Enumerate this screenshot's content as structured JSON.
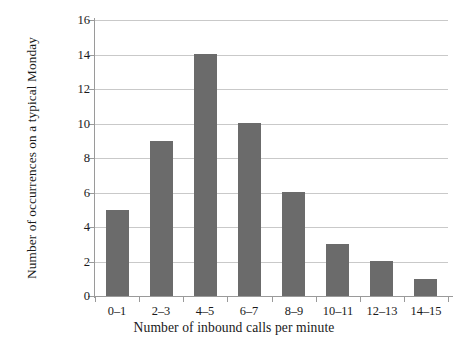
{
  "chart_data": {
    "type": "bar",
    "title": "",
    "subtitle": "",
    "xlabel": "Number of inbound calls per minute",
    "ylabel": "Number of occurrences on a typical Monday",
    "categories": [
      "0–1",
      "2–3",
      "4–5",
      "6–7",
      "8–9",
      "10–11",
      "12–13",
      "14–15"
    ],
    "values": [
      5,
      9,
      14,
      10,
      6,
      3,
      2,
      1
    ],
    "ylim": [
      0,
      16
    ],
    "ytick_step": 2,
    "ytick_labels": [
      "0",
      "2",
      "4",
      "6",
      "8",
      "10",
      "12",
      "14",
      "16"
    ],
    "grid": true,
    "grid_axis": "y",
    "legend": false,
    "legend_position": "none",
    "bar_color": "#6b6b6b",
    "gridline_color": "#c9c9c9",
    "axis_color": "#9a9a9a",
    "background_color": "#ffffff"
  }
}
